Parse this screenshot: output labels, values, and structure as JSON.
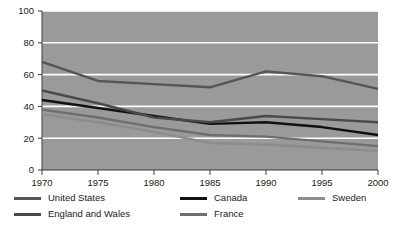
{
  "chart_data": {
    "type": "line",
    "title": "",
    "xlabel": "",
    "ylabel": "",
    "x": [
      1970,
      1975,
      1980,
      1985,
      1990,
      1995,
      2000
    ],
    "xtick_labels": [
      "1970",
      "1975",
      "1980",
      "1985",
      "1990",
      "1995",
      "2000"
    ],
    "ytick_labels": [
      "0",
      "20",
      "40",
      "60",
      "80",
      "100"
    ],
    "yticks": [
      0,
      20,
      40,
      60,
      80,
      100
    ],
    "ylim": [
      0,
      100
    ],
    "xlim": [
      1970,
      2000
    ],
    "grid": true,
    "grid_color": "#ffffff",
    "plot_background": "#9a9a9a",
    "legend_position": "bottom",
    "series": [
      {
        "name": "United States",
        "color": "#555555",
        "values": [
          68,
          56,
          54,
          52,
          62,
          59,
          51
        ]
      },
      {
        "name": "Canada",
        "color": "#111111",
        "values": [
          44,
          39,
          34,
          29,
          30,
          27,
          22
        ]
      },
      {
        "name": "Sweden",
        "color": "#8c8c8c",
        "values": [
          35,
          30,
          24,
          17,
          16,
          14,
          12
        ]
      },
      {
        "name": "England and Wales",
        "color": "#4a4a4a",
        "values": [
          50,
          42,
          33,
          30,
          34,
          32,
          30
        ]
      },
      {
        "name": "France",
        "color": "#6e6e6e",
        "values": [
          38,
          33,
          27,
          22,
          21,
          18,
          15
        ]
      }
    ]
  },
  "legend": {
    "rows": [
      [
        {
          "label": "United States",
          "color": "#555555",
          "icon": "line-swatch"
        },
        {
          "label": "Canada",
          "color": "#111111",
          "icon": "line-swatch"
        },
        {
          "label": "Sweden",
          "color": "#8c8c8c",
          "icon": "line-swatch"
        }
      ],
      [
        {
          "label": "England and Wales",
          "color": "#4a4a4a",
          "icon": "line-swatch"
        },
        {
          "label": "France",
          "color": "#6e6e6e",
          "icon": "line-swatch"
        }
      ]
    ]
  }
}
